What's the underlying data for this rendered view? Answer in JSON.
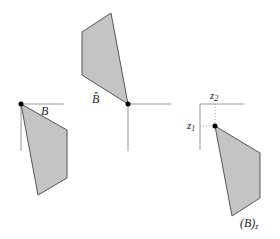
{
  "diagram": {
    "colors": {
      "fill": "#c4c4c4",
      "stroke": "#555555",
      "axis": "#999999",
      "dot": "#000000"
    },
    "panels": [
      {
        "id": "set-B",
        "label": "B",
        "origin": [
          21,
          104
        ],
        "polygon": "21,104 67,130 67,178 38,195",
        "label_pos": [
          41,
          115
        ]
      },
      {
        "id": "reflection-B-hat",
        "label": "B̂",
        "origin": [
          128,
          104
        ],
        "polygon": "128,104 111,13 82,32 82,75",
        "label_pos": [
          92,
          101
        ]
      },
      {
        "id": "translation-B-z",
        "label": "(B)",
        "label_sub": "z",
        "origin": [
          215,
          126
        ],
        "polygon": "215,126 260,153 260,198 232,216",
        "label_pos": [
          247,
          226
        ],
        "axis_labels": {
          "z1": "z",
          "z1_sub": "1",
          "z2": "z",
          "z2_sub": "2"
        }
      }
    ]
  }
}
